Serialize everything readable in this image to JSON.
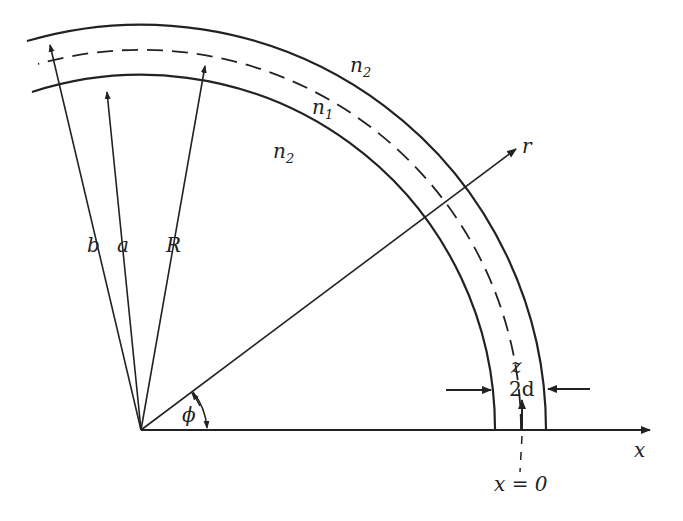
{
  "diagram": {
    "labels": {
      "n2_outer": "n",
      "n2_outer_sub": "2",
      "n1": "n",
      "n1_sub": "1",
      "n2_inner": "n",
      "n2_inner_sub": "2",
      "r_axis": "r",
      "x_axis": "x",
      "b": "b",
      "a": "a",
      "R": "R",
      "phi": "ϕ",
      "z": "z",
      "two_d": "2d",
      "x_eq_0": "x = 0"
    },
    "colors": {
      "line": "#222222",
      "background": "#ffffff"
    }
  }
}
